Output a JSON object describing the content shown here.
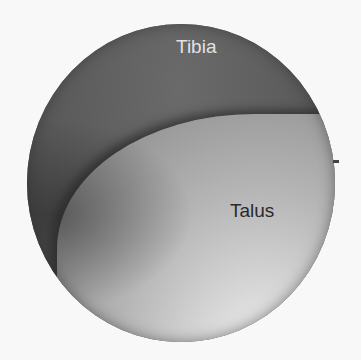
{
  "image": {
    "description": "Arthroscopic view of ankle joint",
    "labels": {
      "tibia": "Tibia",
      "talus": "Talus"
    },
    "colors": {
      "background": "#f8f8f8",
      "tibia_region": "#5e5e5e",
      "talus_highlight": "#f2f2f2",
      "tibia_label": "#e2e2e2",
      "talus_label": "#2a2a2a"
    }
  }
}
